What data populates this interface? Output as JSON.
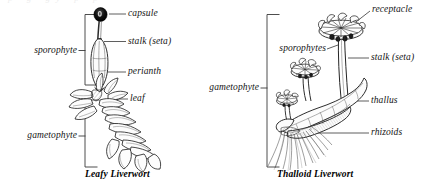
{
  "figure": {
    "background_color": "#ffffff",
    "ink_color": "#1a1a1a",
    "clipped_text_above": "p   g    gy    p    p",
    "panels": [
      {
        "id": "leafy-liverwort",
        "caption": "Leafy Liverwort",
        "brackets": [
          {
            "id": "sporophyte",
            "label": "sporophyte"
          },
          {
            "id": "gametophyte",
            "label": "gametophyte"
          }
        ],
        "callouts": [
          {
            "id": "capsule",
            "label": "capsule"
          },
          {
            "id": "stalk-seta",
            "label": "stalk (seta)"
          },
          {
            "id": "perianth",
            "label": "perianth"
          },
          {
            "id": "leaf",
            "label": "leaf"
          }
        ]
      },
      {
        "id": "thalloid-liverwort",
        "caption": "Thalloid Liverwort",
        "brackets": [
          {
            "id": "gametophyte",
            "label": "gametophyte"
          }
        ],
        "callouts": [
          {
            "id": "receptacle",
            "label": "receptacle"
          },
          {
            "id": "sporophytes",
            "label": "sporophytes"
          },
          {
            "id": "stalk-seta",
            "label": "stalk (seta)"
          },
          {
            "id": "thallus",
            "label": "thallus"
          },
          {
            "id": "rhizoids",
            "label": "rhizoids"
          }
        ]
      }
    ]
  }
}
